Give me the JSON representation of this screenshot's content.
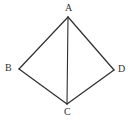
{
  "figure": {
    "kind": "geometry-diagram",
    "background_color": "#ffffff",
    "stroke_color": "#2e2e2d",
    "label_color": "#30302f",
    "width": 132,
    "height": 124,
    "vertices": [
      {
        "name": "A",
        "label": "A",
        "x": 68,
        "y": 17,
        "label_x": 65,
        "label_y": 3
      },
      {
        "name": "B",
        "label": "B",
        "x": 19,
        "y": 69,
        "label_x": 5,
        "label_y": 63
      },
      {
        "name": "C",
        "label": "C",
        "x": 67,
        "y": 104,
        "label_x": 64,
        "label_y": 107
      },
      {
        "name": "D",
        "label": "D",
        "x": 114,
        "y": 70,
        "label_x": 118,
        "label_y": 64
      }
    ],
    "edges": [
      {
        "name": "edge-AB",
        "from": "A",
        "to": "B"
      },
      {
        "name": "edge-AD",
        "from": "A",
        "to": "D"
      },
      {
        "name": "edge-BC",
        "from": "B",
        "to": "C"
      },
      {
        "name": "edge-CD",
        "from": "C",
        "to": "D"
      },
      {
        "name": "diagonal-AC",
        "from": "A",
        "to": "C"
      }
    ]
  }
}
